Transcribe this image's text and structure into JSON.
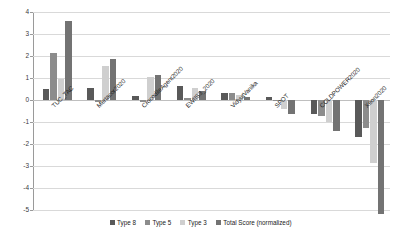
{
  "chart_data": {
    "type": "bar",
    "title": "",
    "subtitle": "",
    "xlabel": "",
    "ylabel": "",
    "ylim": [
      -5,
      4
    ],
    "yticks": [
      4,
      3,
      2,
      1,
      0,
      -1,
      -2,
      -3,
      -4,
      -5
    ],
    "grid": true,
    "legend_position": "bottom",
    "categories": [
      "TUC_TAC",
      "Mertacor2020",
      "CrocodileAgent2020",
      "EWIIS3_2020",
      "VidyutVanika",
      "SPOT",
      "COLDPOWER2020",
      "Xeon2020"
    ],
    "series": [
      {
        "name": "Type 8",
        "color": "#595959",
        "values": [
          0.48,
          0.55,
          0.18,
          0.62,
          0.3,
          0.14,
          -0.62,
          -1.68
        ]
      },
      {
        "name": "Type 5",
        "color": "#8c8c8c",
        "values": [
          2.12,
          -0.1,
          -0.08,
          0.1,
          0.32,
          -0.04,
          -0.72,
          -1.28
        ]
      },
      {
        "name": "Type 3",
        "color": "#cfcfcf",
        "values": [
          0.97,
          1.55,
          1.05,
          0.55,
          0.22,
          -0.4,
          -1.0,
          -2.85
        ]
      },
      {
        "name": "Total Score (normalized)",
        "color": "#737373",
        "values": [
          3.58,
          1.88,
          1.12,
          0.42,
          0.14,
          -0.62,
          -1.42,
          -5.2
        ]
      }
    ]
  }
}
